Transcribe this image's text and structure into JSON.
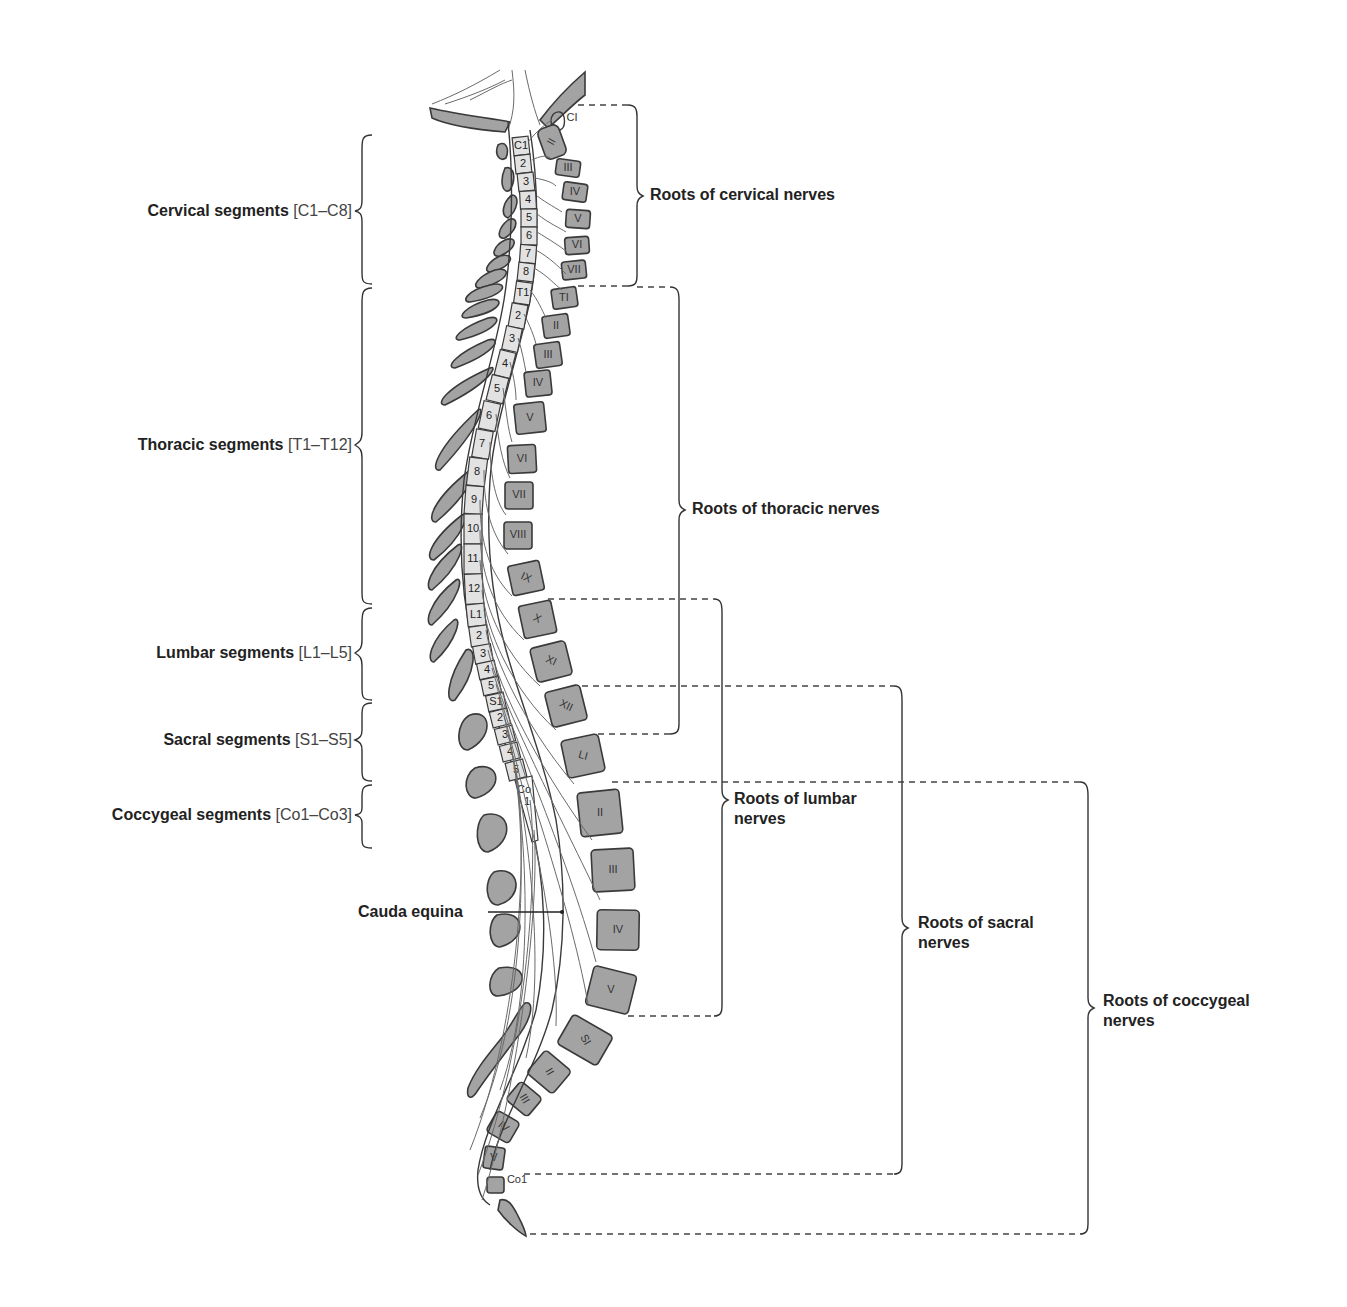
{
  "diagram": {
    "colors": {
      "bone_fill": "#a3a3a3",
      "bone_outline": "#3a3a3a",
      "cord_segment_fill": "#e2e2e2",
      "nerve_line": "#6a6a6a",
      "text": "#222222",
      "bracket_line": "#333333"
    }
  },
  "left_labels": [
    {
      "name": "Cervical segments",
      "range": "[C1–C8]"
    },
    {
      "name": "Thoracic segments",
      "range": "[T1–T12]"
    },
    {
      "name": "Lumbar segments",
      "range": "[L1–L5]"
    },
    {
      "name": "Sacral segments",
      "range": "[S1–S5]"
    },
    {
      "name": "Coccygeal segments",
      "range": "[Co1–Co3]"
    }
  ],
  "right_labels": [
    {
      "line1": "Roots of cervical nerves",
      "line2": ""
    },
    {
      "line1": "Roots of thoracic nerves",
      "line2": ""
    },
    {
      "line1": "Roots of lumbar",
      "line2": "nerves"
    },
    {
      "line1": "Roots of sacral",
      "line2": "nerves"
    },
    {
      "line1": "Roots of coccygeal",
      "line2": "nerves"
    }
  ],
  "pointer_label": "Cauda equina",
  "cord_segments": [
    "C1",
    "2",
    "3",
    "4",
    "5",
    "6",
    "7",
    "8",
    "T1",
    "2",
    "3",
    "4",
    "5",
    "6",
    "7",
    "8",
    "9",
    "10",
    "11",
    "12",
    "L1",
    "2",
    "3",
    "4",
    "5",
    "S1",
    "2",
    "3",
    "4",
    "5",
    "Co 1"
  ],
  "vertebrae_labels": {
    "cervical": [
      "CI",
      "II",
      "III",
      "IV",
      "V",
      "VI",
      "VII"
    ],
    "thoracic": [
      "TI",
      "II",
      "III",
      "IV",
      "V",
      "VI",
      "VII",
      "VIII",
      "IX",
      "X",
      "XI",
      "XII"
    ],
    "lumbar": [
      "LI",
      "II",
      "III",
      "IV",
      "V"
    ],
    "sacral": [
      "SI",
      "II",
      "III",
      "IV",
      "V"
    ],
    "coccygeal": [
      "CoI"
    ]
  }
}
